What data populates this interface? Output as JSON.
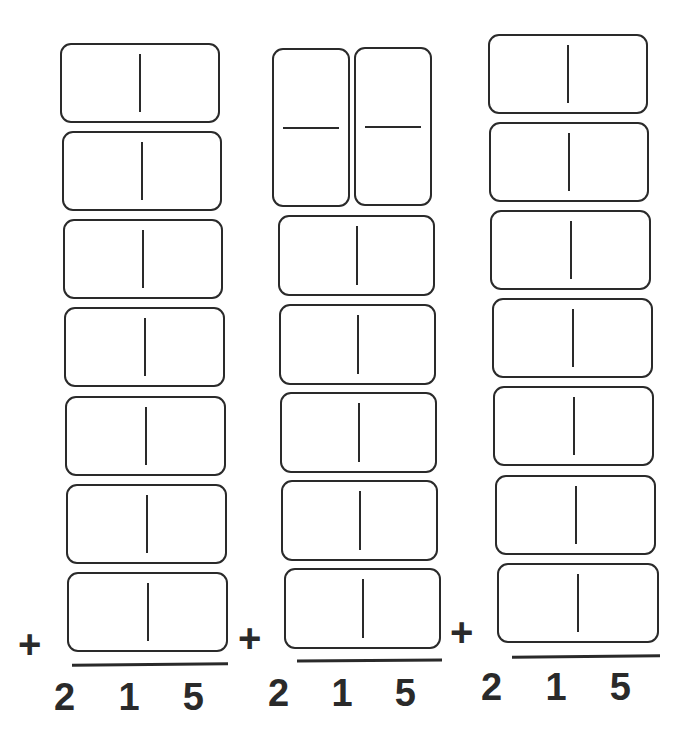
{
  "worksheet": {
    "columns": [
      {
        "dominoes": [
          {
            "orientation": "horizontal",
            "left": "",
            "right": ""
          },
          {
            "orientation": "horizontal",
            "left": "",
            "right": ""
          },
          {
            "orientation": "horizontal",
            "left": "",
            "right": ""
          },
          {
            "orientation": "horizontal",
            "left": "",
            "right": ""
          },
          {
            "orientation": "horizontal",
            "left": "",
            "right": ""
          },
          {
            "orientation": "horizontal",
            "left": "",
            "right": ""
          },
          {
            "orientation": "horizontal",
            "left": "",
            "right": ""
          }
        ],
        "operator": "+",
        "sum_digits": [
          "2",
          "1",
          "5"
        ]
      },
      {
        "dominoes": [
          {
            "orientation": "vertical",
            "top": "",
            "bottom": ""
          },
          {
            "orientation": "vertical",
            "top": "",
            "bottom": ""
          },
          {
            "orientation": "horizontal",
            "left": "",
            "right": ""
          },
          {
            "orientation": "horizontal",
            "left": "",
            "right": ""
          },
          {
            "orientation": "horizontal",
            "left": "",
            "right": ""
          },
          {
            "orientation": "horizontal",
            "left": "",
            "right": ""
          },
          {
            "orientation": "horizontal",
            "left": "",
            "right": ""
          }
        ],
        "operator": "+",
        "sum_digits": [
          "2",
          "1",
          "5"
        ]
      },
      {
        "dominoes": [
          {
            "orientation": "horizontal",
            "left": "",
            "right": ""
          },
          {
            "orientation": "horizontal",
            "left": "",
            "right": ""
          },
          {
            "orientation": "horizontal",
            "left": "",
            "right": ""
          },
          {
            "orientation": "horizontal",
            "left": "",
            "right": ""
          },
          {
            "orientation": "horizontal",
            "left": "",
            "right": ""
          },
          {
            "orientation": "horizontal",
            "left": "",
            "right": ""
          },
          {
            "orientation": "horizontal",
            "left": "",
            "right": ""
          }
        ],
        "operator": "+",
        "sum_digits": [
          "2",
          "1",
          "5"
        ]
      }
    ]
  }
}
